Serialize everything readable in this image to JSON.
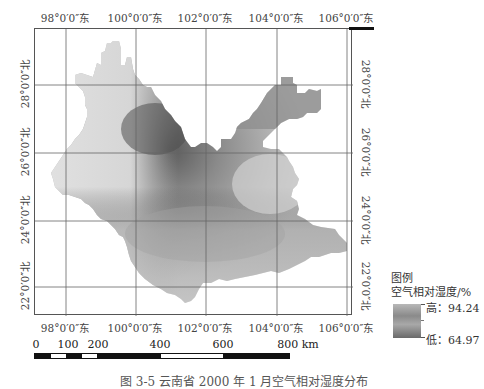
{
  "map": {
    "type": "raster-choropleth",
    "subject": "空气相对湿度",
    "top_ticks": [
      "98°0′0″东",
      "100°0′0″东",
      "102°0′0″东",
      "104°0′0″东",
      "106°0′0″东"
    ],
    "bottom_ticks": [
      "98°0′0″东",
      "100°0′0″东",
      "102°0′0″东",
      "104°0′0″东",
      "106°0′0″东"
    ],
    "left_ticks": [
      "28°0′0″北",
      "26°0′0″北",
      "24°0′0″北",
      "22°0′0″北"
    ],
    "right_ticks": [
      "28°0′0″北",
      "26°0′0″北",
      "24°0′0″北",
      "22°0′0″北"
    ]
  },
  "legend": {
    "title": "图例",
    "subtitle": "空气相对湿度/%",
    "high_label": "高：94.24",
    "low_label": "低：64.97",
    "high_value": 94.24,
    "low_value": 64.97,
    "gradient_colors": [
      "#6e6e6e",
      "#d8d8d8"
    ]
  },
  "scale_bar": {
    "labels": [
      "0",
      "100",
      "200",
      "400",
      "600",
      "800 km"
    ],
    "unit": "km"
  },
  "caption": "图 3-5  云南省 2000 年 1 月空气相对湿度分布"
}
